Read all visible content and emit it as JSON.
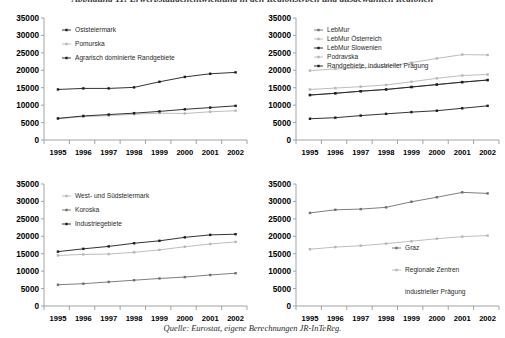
{
  "figure": {
    "title": "Abbildung 11:  Erwerbstätigenentwicklung in den Regionstypen und ausgewählten Regionen",
    "caption": "Quelle: Eurostat, eigene Berechnungen JR-InTeReg."
  },
  "axis": {
    "y_ticks": [
      "35000",
      "30000",
      "25000",
      "20000",
      "15000",
      "10000",
      "5000",
      "0"
    ],
    "x_ticks": [
      "1995",
      "1996",
      "1997",
      "1998",
      "1999",
      "2000",
      "2001",
      "2002"
    ],
    "ylim": [
      0,
      35000
    ]
  },
  "colors": {
    "dark": "#1c1c1c",
    "mid": "#6f6f6f",
    "light": "#b6b6b6",
    "axis": "#9a9a9a",
    "text": "#000000"
  },
  "chart_data": [
    {
      "id": "top-left",
      "type": "line",
      "title": "",
      "xlabel": "",
      "ylabel": "",
      "ylim": [
        0,
        35000
      ],
      "grid": false,
      "legend_position": "top-left-inside",
      "x": [
        "1995",
        "1996",
        "1997",
        "1998",
        "1999",
        "2000",
        "2001",
        "2002"
      ],
      "series": [
        {
          "name": "Oststeiermark",
          "values": [
            14500,
            14800,
            14800,
            15100,
            16700,
            18100,
            19000,
            19400
          ]
        },
        {
          "name": "Pomurska",
          "values": [
            6100,
            6700,
            7000,
            7400,
            7700,
            7600,
            8100,
            8400
          ]
        },
        {
          "name": "Agrarisch dominierte Randgebiete",
          "values": [
            6200,
            6900,
            7300,
            7700,
            8200,
            8800,
            9300,
            9800
          ]
        }
      ]
    },
    {
      "id": "top-right",
      "type": "line",
      "title": "",
      "xlabel": "",
      "ylabel": "",
      "ylim": [
        0,
        35000
      ],
      "grid": false,
      "legend_position": "top-left-inside",
      "x": [
        "1995",
        "1996",
        "1997",
        "1998",
        "1999",
        "2000",
        "2001",
        "2002"
      ],
      "series": [
        {
          "name": "LebMur",
          "values": [
            12900,
            13400,
            14000,
            14500,
            15200,
            15900,
            16600,
            17200
          ]
        },
        {
          "name": "LebMur Österreich",
          "values": [
            14500,
            14900,
            15300,
            15800,
            16700,
            17700,
            18500,
            18800
          ]
        },
        {
          "name": "LebMur Slowenien",
          "values": [
            6100,
            6400,
            7000,
            7500,
            8000,
            8400,
            9100,
            9800
          ]
        },
        {
          "name": "Podravska",
          "values": [
            19900,
            20400,
            20700,
            21100,
            22200,
            23400,
            24500,
            24400
          ]
        },
        {
          "name": "Randgebiete, industrieller Prägung",
          "values": [
            12900,
            13400,
            14000,
            14500,
            15200,
            15900,
            16600,
            17200
          ]
        }
      ]
    },
    {
      "id": "bottom-left",
      "type": "line",
      "title": "",
      "xlabel": "",
      "ylabel": "",
      "ylim": [
        0,
        35000
      ],
      "grid": false,
      "legend_position": "top-left-inside",
      "x": [
        "1995",
        "1996",
        "1997",
        "1998",
        "1999",
        "2000",
        "2001",
        "2002"
      ],
      "series": [
        {
          "name": "West- und Südsteiermark",
          "values": [
            14500,
            14800,
            14900,
            15400,
            16100,
            17000,
            17800,
            18400
          ]
        },
        {
          "name": "Koroska",
          "values": [
            6100,
            6400,
            6900,
            7400,
            7900,
            8300,
            8900,
            9400
          ]
        },
        {
          "name": "Industriegebiete",
          "values": [
            15600,
            16400,
            17100,
            18000,
            18700,
            19700,
            20400,
            20600
          ]
        }
      ]
    },
    {
      "id": "bottom-right",
      "type": "line",
      "title": "",
      "xlabel": "",
      "ylabel": "",
      "ylim": [
        0,
        35000
      ],
      "grid": false,
      "legend_position": "center-right-inside",
      "x": [
        "1995",
        "1996",
        "1997",
        "1998",
        "1999",
        "2000",
        "2001",
        "2002"
      ],
      "series": [
        {
          "name": "Graz",
          "values": [
            26700,
            27600,
            27800,
            28300,
            29900,
            31200,
            32600,
            32300
          ]
        },
        {
          "name": "Regionale Zentren industrieller Prägung",
          "values": [
            16300,
            16900,
            17300,
            17900,
            18600,
            19300,
            19900,
            20200
          ]
        }
      ]
    }
  ],
  "legends": {
    "top_left": [
      {
        "label": "Oststeiermark",
        "tone": "dark"
      },
      {
        "label": "Pomurska",
        "tone": "light"
      },
      {
        "label": "Agrarisch dominierte Randgebiete",
        "tone": "dark"
      }
    ],
    "top_right": [
      {
        "label": "LebMur",
        "tone": "mid"
      },
      {
        "label": "LebMur Österreich",
        "tone": "light"
      },
      {
        "label": "LebMur Slowenien",
        "tone": "dark"
      },
      {
        "label": "Podravska",
        "tone": "light"
      },
      {
        "label": "Randgebiete, industrieller Prägung",
        "tone": "dark"
      }
    ],
    "bottom_left": [
      {
        "label": "West- und Südsteiermark",
        "tone": "light"
      },
      {
        "label": "Koroska",
        "tone": "mid"
      },
      {
        "label": "Industriegebiete",
        "tone": "dark"
      }
    ],
    "bottom_right": [
      {
        "label": "Graz",
        "tone": "mid"
      },
      {
        "label": "Regionale Zentren",
        "tone": "light"
      },
      {
        "label": "industrieller Prägung",
        "tone": "none"
      }
    ]
  }
}
